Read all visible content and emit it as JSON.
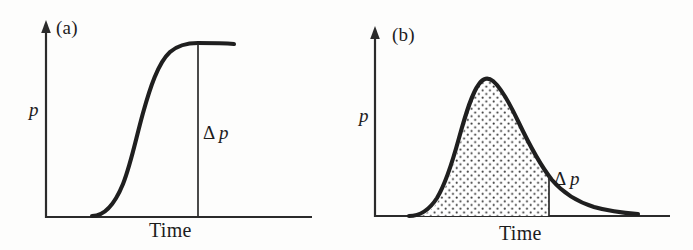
{
  "figure": {
    "panels": [
      {
        "id": "a",
        "label": "(a)",
        "y_axis_label": "p",
        "x_axis_label": "Time",
        "delta_label": "Δ p",
        "curve_type": "sigmoid",
        "shaded": false
      },
      {
        "id": "b",
        "label": "(b)",
        "y_axis_label": "p",
        "x_axis_label": "Time",
        "delta_label": "Δ p",
        "curve_type": "rise-and-decay",
        "shaded": true
      }
    ]
  },
  "chart_data": [
    {
      "type": "line",
      "title": "(a)",
      "xlabel": "Time",
      "ylabel": "p",
      "grid": false,
      "legend": false,
      "annotations": [
        {
          "text": "Δ p",
          "kind": "vertical-drop-line",
          "x": 0.62,
          "y_from": 0.0,
          "y_to": 1.0
        }
      ],
      "axis_style": "arrow-y-open-x",
      "x": [
        0.0,
        0.1,
        0.18,
        0.24,
        0.3,
        0.34,
        0.38,
        0.42,
        0.46,
        0.5,
        0.54,
        0.58,
        0.62,
        0.7,
        0.8,
        0.92,
        1.0
      ],
      "y": [
        0.0,
        0.0,
        0.01,
        0.04,
        0.1,
        0.18,
        0.3,
        0.45,
        0.6,
        0.73,
        0.83,
        0.91,
        0.96,
        1.0,
        1.0,
        0.99,
        0.98
      ],
      "xlim": [
        0,
        1
      ],
      "ylim": [
        0,
        1.05
      ]
    },
    {
      "type": "area",
      "title": "(b)",
      "xlabel": "Time",
      "ylabel": "p",
      "grid": false,
      "legend": false,
      "fill_pattern": "stipple-dots",
      "fill_x_range": [
        0.14,
        0.55
      ],
      "annotations": [
        {
          "text": "Δ p",
          "kind": "vertical-drop-line",
          "x": 0.55,
          "y_from": 0.0,
          "y_to": 0.62
        }
      ],
      "axis_style": "arrow-y-open-x",
      "x": [
        0.0,
        0.08,
        0.14,
        0.18,
        0.22,
        0.26,
        0.3,
        0.34,
        0.38,
        0.42,
        0.45,
        0.5,
        0.55,
        0.62,
        0.7,
        0.8,
        0.9,
        1.0
      ],
      "y": [
        0.0,
        0.0,
        0.02,
        0.1,
        0.26,
        0.46,
        0.66,
        0.83,
        0.95,
        1.0,
        0.99,
        0.88,
        0.74,
        0.58,
        0.44,
        0.31,
        0.24,
        0.22
      ],
      "xlim": [
        0,
        1
      ],
      "ylim": [
        0,
        1.05
      ]
    }
  ]
}
